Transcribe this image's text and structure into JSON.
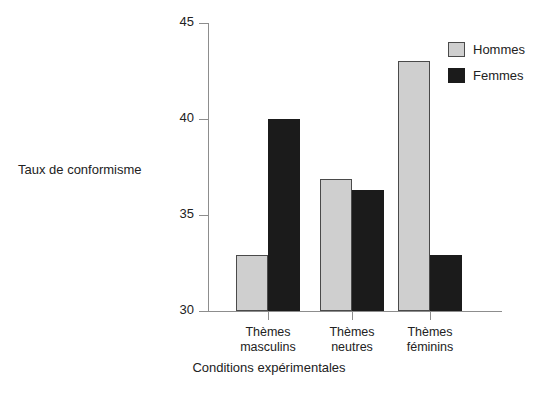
{
  "figure": {
    "top_caption": "",
    "background_color": "#ffffff"
  },
  "chart_data": {
    "type": "bar",
    "title": "",
    "xlabel": "Conditions expérimentales",
    "ylabel": "Taux de conformisme",
    "categories": [
      "Thèmes masculins",
      "Thèmes neutres",
      "Thèmes féminins"
    ],
    "category_lines": [
      [
        "Thèmes",
        "masculins"
      ],
      [
        "Thèmes",
        "neutres"
      ],
      [
        "Thèmes",
        "féminins"
      ]
    ],
    "series": [
      {
        "name": "Hommes",
        "color": "#cfcfcf",
        "values": [
          32.9,
          36.9,
          43.0
        ]
      },
      {
        "name": "Femmes",
        "color": "#1b1b1b",
        "values": [
          40.0,
          36.3,
          32.9
        ]
      }
    ],
    "ylim": [
      30,
      45
    ],
    "yticks": [
      30,
      35,
      40,
      45
    ],
    "ytick_labels": [
      "30",
      "35",
      "40",
      "45"
    ],
    "grid": false,
    "legend_position": "top-right",
    "xlim_note": "categorical, 3 groups of 2 adjacent bars"
  },
  "axis": {
    "y_labels": [
      "45",
      "40",
      "35",
      "30"
    ],
    "y_values": [
      45,
      40,
      35,
      30
    ],
    "x_title": "Conditions expérimentales",
    "y_title": "Taux de conformisme"
  },
  "legend": {
    "items": [
      {
        "label": "Hommes",
        "swatch": "hommes"
      },
      {
        "label": "Femmes",
        "swatch": "femmes"
      }
    ]
  }
}
